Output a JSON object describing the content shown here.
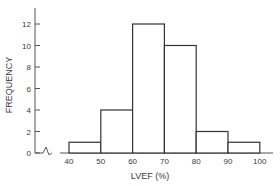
{
  "chart_data": {
    "type": "bar",
    "title": "",
    "xlabel": "LVEF (%)",
    "ylabel": "FREQUENCY",
    "bins": [
      [
        40,
        50
      ],
      [
        50,
        60
      ],
      [
        60,
        70
      ],
      [
        70,
        80
      ],
      [
        80,
        90
      ],
      [
        90,
        100
      ]
    ],
    "categories": [
      "40-50",
      "50-60",
      "60-70",
      "70-80",
      "80-90",
      "90-100"
    ],
    "values": [
      1,
      4,
      12,
      10,
      2,
      1
    ],
    "x_tick_labels": [
      "40",
      "50",
      "60",
      "70",
      "80",
      "90",
      "100"
    ],
    "y_tick_labels": [
      "0",
      "2",
      "4",
      "6",
      "8",
      "10",
      "12"
    ],
    "ylim": [
      0,
      13
    ],
    "xlim": [
      40,
      100
    ],
    "axis_break": true,
    "grid": false,
    "legend": null,
    "colors": {
      "bar_fill": "#ffffff",
      "bar_stroke": "#333333",
      "axis": "#555555"
    }
  }
}
